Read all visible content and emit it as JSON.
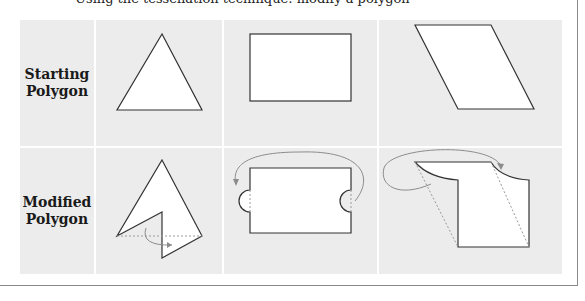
{
  "caption_cut": "Using the tessellation technique: modify a polygon",
  "rows": [
    {
      "label_line1": "Starting",
      "label_line2": "Polygon"
    },
    {
      "label_line1": "Modified",
      "label_line2": "Polygon"
    }
  ],
  "shapes": {
    "starting": [
      "triangle",
      "rectangle",
      "parallelogram"
    ],
    "modified": [
      "triangle-notch-rotation",
      "rectangle-semicircle-translation",
      "parallelogram-arc-translation"
    ]
  },
  "colors": {
    "cell_bg": "#ececec",
    "shape_fill": "#ffffff",
    "shape_stroke": "#333333",
    "arrow_stroke": "#8c8c8c",
    "dashed_stroke": "#9a9a9a"
  }
}
